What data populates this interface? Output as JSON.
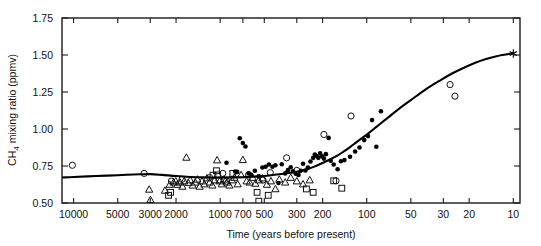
{
  "chart_data": {
    "type": "scatter",
    "title": "",
    "xlabel": "Time (years before present)",
    "ylabel": "CH4 mixing ratio (ppmv)",
    "ylabel_display": "CH₄ mixing ratio (ppmv)",
    "xscale": "log",
    "x_reversed": true,
    "xlim": [
      12000,
      9
    ],
    "ylim": [
      0.5,
      1.75
    ],
    "grid": false,
    "legend": "none",
    "yticks": [
      0.5,
      0.75,
      1.0,
      1.25,
      1.5,
      1.75
    ],
    "ytick_labels": [
      "0.50",
      "0.75",
      "1.00",
      "1.25",
      "1.50",
      "1.75"
    ],
    "xticks": [
      10000,
      5000,
      3000,
      2000,
      1000,
      700,
      500,
      300,
      200,
      100,
      50,
      30,
      20,
      10
    ],
    "xtick_labels": [
      "10000",
      "5000",
      "3000",
      "2000",
      "1000",
      "700",
      "500",
      "300",
      "200",
      "100",
      "50",
      "30",
      "20",
      "10"
    ],
    "series": [
      {
        "name": "open-circle",
        "marker": "circle-open",
        "points": [
          [
            10200,
            0.755
          ],
          [
            3300,
            0.7
          ],
          [
            2150,
            0.648
          ],
          [
            1820,
            0.66
          ],
          [
            1180,
            0.672
          ],
          [
            1020,
            0.655
          ],
          [
            960,
            0.7
          ],
          [
            905,
            0.648
          ],
          [
            640,
            0.69
          ],
          [
            510,
            0.655
          ],
          [
            455,
            0.705
          ],
          [
            352,
            0.805
          ],
          [
            300,
            0.72
          ],
          [
            196,
            0.963
          ],
          [
            162,
            0.65
          ],
          [
            128,
            1.088
          ],
          [
            27,
            1.3
          ],
          [
            25,
            1.222
          ]
        ]
      },
      {
        "name": "open-triangle",
        "marker": "triangle-open",
        "points": [
          [
            3050,
            0.592
          ],
          [
            2990,
            0.522
          ],
          [
            2380,
            0.585
          ],
          [
            2210,
            0.625
          ],
          [
            2080,
            0.64
          ],
          [
            2010,
            0.648
          ],
          [
            1960,
            0.625
          ],
          [
            1880,
            0.64
          ],
          [
            1810,
            0.612
          ],
          [
            1760,
            0.648
          ],
          [
            1700,
            0.808
          ],
          [
            1650,
            0.638
          ],
          [
            1600,
            0.655
          ],
          [
            1540,
            0.62
          ],
          [
            1480,
            0.64
          ],
          [
            1430,
            0.66
          ],
          [
            1380,
            0.612
          ],
          [
            1330,
            0.648
          ],
          [
            1280,
            0.628
          ],
          [
            1230,
            0.668
          ],
          [
            1180,
            0.64
          ],
          [
            1130,
            0.62
          ],
          [
            1090,
            0.655
          ],
          [
            1050,
            0.79
          ],
          [
            1010,
            0.648
          ],
          [
            975,
            0.628
          ],
          [
            940,
            0.66
          ],
          [
            900,
            0.64
          ],
          [
            865,
            0.62
          ],
          [
            830,
            0.655
          ],
          [
            800,
            0.672
          ],
          [
            760,
            0.628
          ],
          [
            720,
            0.69
          ],
          [
            700,
            0.792
          ],
          [
            660,
            0.648
          ],
          [
            630,
            0.64
          ],
          [
            600,
            0.672
          ],
          [
            575,
            0.632
          ],
          [
            545,
            0.655
          ],
          [
            515,
            0.668
          ],
          [
            480,
            0.625
          ],
          [
            450,
            0.648
          ],
          [
            420,
            0.595
          ],
          [
            395,
            0.66
          ],
          [
            360,
            0.64
          ],
          [
            330,
            0.672
          ],
          [
            300,
            0.648
          ],
          [
            272,
            0.628
          ],
          [
            245,
            0.655
          ]
        ]
      },
      {
        "name": "open-square",
        "marker": "square-open",
        "points": [
          [
            2250,
            0.552
          ],
          [
            2180,
            0.572
          ],
          [
            1120,
            0.688
          ],
          [
            1060,
            0.718
          ],
          [
            1040,
            0.69
          ],
          [
            820,
            0.7
          ],
          [
            560,
            0.572
          ],
          [
            545,
            0.512
          ],
          [
            470,
            0.552
          ],
          [
            258,
            0.595
          ],
          [
            232,
            0.572
          ],
          [
            168,
            0.65
          ],
          [
            148,
            0.6
          ]
        ]
      },
      {
        "name": "filled-circle",
        "marker": "circle-filled",
        "points": [
          [
            905,
            0.772
          ],
          [
            790,
            0.712
          ],
          [
            765,
            0.71
          ],
          [
            735,
            0.938
          ],
          [
            700,
            0.905
          ],
          [
            672,
            0.882
          ],
          [
            640,
            0.7
          ],
          [
            615,
            0.69
          ],
          [
            580,
            0.718
          ],
          [
            545,
            0.68
          ],
          [
            515,
            0.74
          ],
          [
            490,
            0.745
          ],
          [
            465,
            0.76
          ],
          [
            440,
            0.745
          ],
          [
            420,
            0.755
          ],
          [
            400,
            0.635
          ],
          [
            380,
            0.762
          ],
          [
            360,
            0.7
          ],
          [
            345,
            0.722
          ],
          [
            330,
            0.742
          ],
          [
            318,
            0.715
          ],
          [
            305,
            0.698
          ],
          [
            292,
            0.69
          ],
          [
            282,
            0.718
          ],
          [
            272,
            0.765
          ],
          [
            262,
            0.72
          ],
          [
            252,
            0.74
          ],
          [
            242,
            0.78
          ],
          [
            232,
            0.805
          ],
          [
            226,
            0.828
          ],
          [
            220,
            0.818
          ],
          [
            214,
            0.805
          ],
          [
            208,
            0.835
          ],
          [
            202,
            0.815
          ],
          [
            196,
            0.8
          ],
          [
            190,
            0.83
          ],
          [
            182,
            0.94
          ],
          [
            176,
            0.785
          ],
          [
            168,
            0.76
          ],
          [
            158,
            0.728
          ],
          [
            150,
            0.782
          ],
          [
            142,
            0.79
          ],
          [
            130,
            0.812
          ],
          [
            120,
            0.848
          ],
          [
            112,
            0.875
          ],
          [
            104,
            0.925
          ],
          [
            98,
            0.952
          ],
          [
            92,
            1.06
          ],
          [
            86,
            0.88
          ],
          [
            80,
            1.12
          ]
        ]
      },
      {
        "name": "modern-value",
        "marker": "asterisk",
        "points": [
          [
            10,
            1.51
          ]
        ]
      }
    ],
    "fit_curve": {
      "name": "fitted-trend",
      "points": [
        [
          12000,
          0.672
        ],
        [
          10000,
          0.676
        ],
        [
          7000,
          0.682
        ],
        [
          5000,
          0.688
        ],
        [
          3500,
          0.694
        ],
        [
          3000,
          0.695
        ],
        [
          2500,
          0.69
        ],
        [
          2000,
          0.682
        ],
        [
          1600,
          0.676
        ],
        [
          1300,
          0.673
        ],
        [
          1000,
          0.672
        ],
        [
          800,
          0.673
        ],
        [
          650,
          0.676
        ],
        [
          550,
          0.68
        ],
        [
          450,
          0.688
        ],
        [
          380,
          0.696
        ],
        [
          330,
          0.704
        ],
        [
          290,
          0.714
        ],
        [
          255,
          0.728
        ],
        [
          225,
          0.748
        ],
        [
          200,
          0.77
        ],
        [
          180,
          0.792
        ],
        [
          160,
          0.818
        ],
        [
          145,
          0.845
        ],
        [
          130,
          0.878
        ],
        [
          115,
          0.918
        ],
        [
          100,
          0.962
        ],
        [
          85,
          1.018
        ],
        [
          72,
          1.075
        ],
        [
          60,
          1.138
        ],
        [
          50,
          1.195
        ],
        [
          40,
          1.265
        ],
        [
          32,
          1.325
        ],
        [
          25,
          1.385
        ],
        [
          18,
          1.45
        ],
        [
          13,
          1.492
        ],
        [
          10,
          1.512
        ]
      ]
    }
  },
  "axes": {
    "x_title": "Time (years before present)",
    "y_title_prefix": "CH",
    "y_title_sub": "4",
    "y_title_suffix": " mixing ratio (ppmv)"
  }
}
